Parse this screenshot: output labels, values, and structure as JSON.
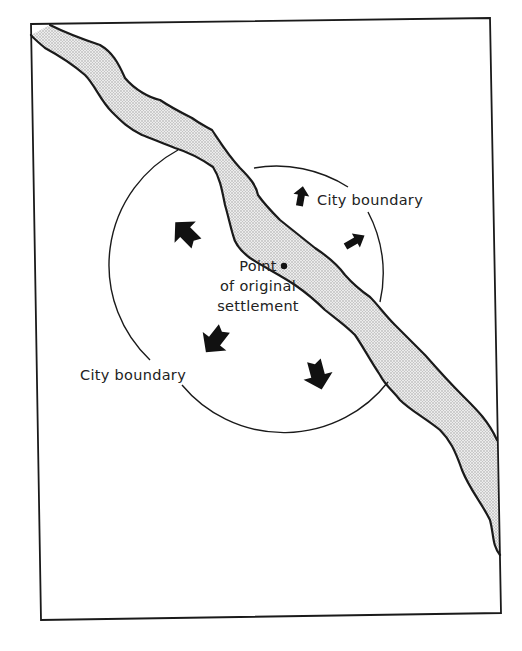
{
  "figure": {
    "type": "map-diagram",
    "labels": {
      "city_boundary_ne": "City boundary",
      "city_boundary_sw": "City boundary",
      "settlement_line1": "Point",
      "settlement_line2": "of original",
      "settlement_line3": "settlement"
    },
    "elements": {
      "frame": "map-frame",
      "river": "river (stippled)",
      "circle": "city boundary circle",
      "settlement_point": "dot marking original settlement",
      "arrows": [
        {
          "id": "arrow-nw",
          "direction": "northwest",
          "size": "large"
        },
        {
          "id": "arrow-n",
          "direction": "north",
          "size": "small"
        },
        {
          "id": "arrow-ne",
          "direction": "northeast",
          "size": "small"
        },
        {
          "id": "arrow-sw",
          "direction": "southwest",
          "size": "large"
        },
        {
          "id": "arrow-s",
          "direction": "south-southeast",
          "size": "large"
        }
      ]
    },
    "colors": {
      "ink": "#1a1a1a",
      "river_fill": "#d9d9d9",
      "background": "#ffffff"
    }
  }
}
